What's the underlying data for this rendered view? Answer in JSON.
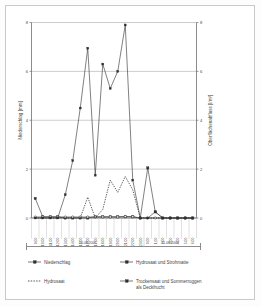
{
  "figure": {
    "background_color": "#ffffff",
    "frame_color": "#c9c9c9",
    "line_color": "#3d3d3d",
    "grid_color": "#9a9a9a"
  },
  "axes": {
    "y_left": {
      "title": "Niederschlag [mm]",
      "ticks": [
        "0",
        "2",
        "4",
        "6",
        "8"
      ],
      "min": 0,
      "max": 8
    },
    "y_right": {
      "title": "Oberflächenabfluss [l/m²]",
      "ticks": [
        "0",
        "2",
        "4",
        "6",
        "8"
      ],
      "min": 0,
      "max": 8
    },
    "x": {
      "tick_labels": [
        "9:00",
        "10:00",
        "11:00",
        "12:00",
        "13:00",
        "14:00",
        "15:00",
        "16:00",
        "17:00",
        "18:00",
        "19:00",
        "20:00",
        "21:00",
        "22:00",
        "23:00",
        "0:00",
        "1:00",
        "2:00",
        "3:00",
        "4:00",
        "5:00",
        "6:00"
      ],
      "group_labels": [
        {
          "text": "10.08.2001",
          "start_index": 0,
          "end_index": 14
        },
        {
          "text": "11.08.2001",
          "start_index": 15,
          "end_index": 21
        }
      ]
    }
  },
  "legend": {
    "items": [
      {
        "label": "Niederschlag",
        "marker": "square",
        "style": "solid"
      },
      {
        "label": "Hydrosaat und Strohmatte",
        "marker": "square",
        "style": "solid"
      },
      {
        "label": "Hydrosaat",
        "marker": "none",
        "style": "dotted"
      },
      {
        "label": "Trockensaat und Sommerroggen als Deckfrucht",
        "label_line1": "Trockensaat und Sommerroggen",
        "label_line2": "als Deckfrucht",
        "marker": "square",
        "style": "solid"
      }
    ]
  },
  "chart_data": {
    "type": "line",
    "title": "",
    "xlabel": "",
    "ylabel": "Niederschlag [mm]",
    "y2label": "Oberflächenabfluss [l/m²]",
    "ylim": [
      0,
      8
    ],
    "y2lim": [
      0,
      8
    ],
    "grid": true,
    "legend_position": "bottom",
    "x": [
      "9:00",
      "10:00",
      "11:00",
      "12:00",
      "13:00",
      "14:00",
      "15:00",
      "16:00",
      "17:00",
      "18:00",
      "19:00",
      "20:00",
      "21:00",
      "22:00",
      "23:00",
      "0:00",
      "1:00",
      "2:00",
      "3:00",
      "4:00",
      "5:00",
      "6:00"
    ],
    "dates": [
      "10.08.2001",
      "10.08.2001",
      "10.08.2001",
      "10.08.2001",
      "10.08.2001",
      "10.08.2001",
      "10.08.2001",
      "10.08.2001",
      "10.08.2001",
      "10.08.2001",
      "10.08.2001",
      "10.08.2001",
      "10.08.2001",
      "10.08.2001",
      "10.08.2001",
      "11.08.2001",
      "11.08.2001",
      "11.08.2001",
      "11.08.2001",
      "11.08.2001",
      "11.08.2001",
      "11.08.2001"
    ],
    "series": [
      {
        "name": "Niederschlag",
        "axis": "left",
        "marker": "square",
        "style": "solid",
        "values": [
          0.8,
          0.05,
          0.05,
          0.05,
          0,
          0,
          0,
          0,
          0.05,
          0.05,
          0.05,
          0.05,
          0.05,
          0.05,
          0,
          2.05,
          0.25,
          0,
          0,
          0,
          0,
          0
        ]
      },
      {
        "name": "Hydrosaat und Strohmatte",
        "axis": "right",
        "marker": "open-circle",
        "style": "solid",
        "values": [
          0.04,
          0.04,
          0.04,
          0.04,
          0.04,
          0.04,
          0.04,
          0.04,
          0.04,
          0.04,
          0.04,
          0.04,
          0.06,
          0.05,
          0,
          0,
          0,
          0,
          0,
          0,
          0,
          0
        ]
      },
      {
        "name": "Hydrosaat",
        "axis": "right",
        "marker": "none",
        "style": "dotted",
        "values": [
          0,
          0,
          0,
          0,
          0,
          0,
          0,
          0.85,
          0,
          0.35,
          1.55,
          1.05,
          1.7,
          1.15,
          0,
          0,
          0,
          0,
          0,
          0,
          0,
          0
        ]
      },
      {
        "name": "Trockensaat und Sommerroggen als Deckfrucht",
        "axis": "right",
        "marker": "triangle",
        "style": "solid",
        "values": [
          0,
          0,
          0,
          0,
          0.95,
          2.35,
          4.5,
          6.95,
          1.75,
          6.3,
          5.3,
          6.0,
          7.9,
          1.55,
          0,
          0,
          0.25,
          0,
          0,
          0,
          0,
          0
        ]
      }
    ]
  }
}
